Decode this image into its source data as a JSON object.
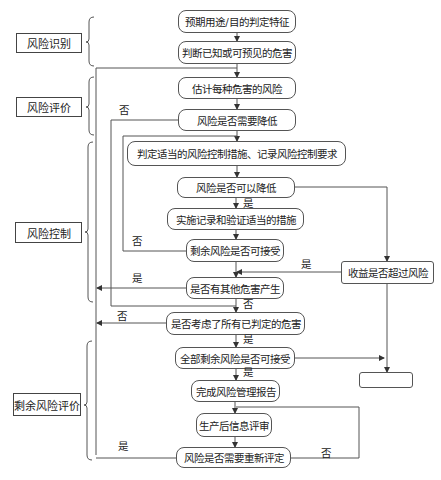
{
  "diagram": {
    "type": "flowchart",
    "stages": [
      {
        "id": "s1",
        "label": "风险识别"
      },
      {
        "id": "s2",
        "label": "风险评价"
      },
      {
        "id": "s3",
        "label": "风险控制"
      },
      {
        "id": "s4",
        "label": "剩余风险评价"
      }
    ],
    "nodes": [
      {
        "id": "n1",
        "label": "预期用途/目的判定特征"
      },
      {
        "id": "n2",
        "label": "判断已知或可预见的危害"
      },
      {
        "id": "n3",
        "label": "估计每种危害的风险"
      },
      {
        "id": "n4",
        "label": "风险是否需要降低"
      },
      {
        "id": "n5",
        "label": "判定适当的风险控制措施、记录风险控制要求"
      },
      {
        "id": "n6",
        "label": "风险是否可以降低"
      },
      {
        "id": "n7",
        "label": "实施记录和验证适当的措施"
      },
      {
        "id": "n8",
        "label": "剩余风险是否可接受"
      },
      {
        "id": "n9",
        "label": "是否有其他危害产生"
      },
      {
        "id": "n10",
        "label": "是否考虑了所有已判定的危害"
      },
      {
        "id": "n11",
        "label": "全部剩余风险是否可接受"
      },
      {
        "id": "n12",
        "label": "完成风险管理报告"
      },
      {
        "id": "n13",
        "label": "生产后信息评审"
      },
      {
        "id": "n14",
        "label": "风险是否需要重新评定"
      },
      {
        "id": "r1",
        "label": "收益是否超过风险"
      },
      {
        "id": "r2",
        "label": ""
      }
    ],
    "edge_labels": {
      "yes": "是",
      "no": "否"
    },
    "edges": [
      {
        "from": "n1",
        "to": "n2"
      },
      {
        "from": "n2",
        "to": "n3"
      },
      {
        "from": "n3",
        "to": "n4"
      },
      {
        "from": "n4",
        "to": "n5"
      },
      {
        "from": "n4",
        "to": "n10",
        "label": "否"
      },
      {
        "from": "n5",
        "to": "n6"
      },
      {
        "from": "n6",
        "to": "n7",
        "label": "是"
      },
      {
        "from": "n6",
        "to": "r1"
      },
      {
        "from": "n7",
        "to": "n8"
      },
      {
        "from": "n8",
        "to": "n5",
        "label": "否"
      },
      {
        "from": "n8",
        "to": "n9"
      },
      {
        "from": "r1",
        "to": "n9",
        "label": "是"
      },
      {
        "from": "r1",
        "to": "r2"
      },
      {
        "from": "n9",
        "to": "n3",
        "label": "是"
      },
      {
        "from": "n9",
        "to": "n10",
        "label": "否"
      },
      {
        "from": "n10",
        "to": "n3",
        "label": "否"
      },
      {
        "from": "n10",
        "to": "n11",
        "label": "是"
      },
      {
        "from": "n11",
        "to": "n12",
        "label": "是"
      },
      {
        "from": "n11",
        "to": "r2"
      },
      {
        "from": "n12",
        "to": "n13"
      },
      {
        "from": "n13",
        "to": "n14"
      },
      {
        "from": "n14",
        "to": "n3",
        "label": "是"
      },
      {
        "from": "n14",
        "to": "n13",
        "label": "否"
      }
    ]
  }
}
